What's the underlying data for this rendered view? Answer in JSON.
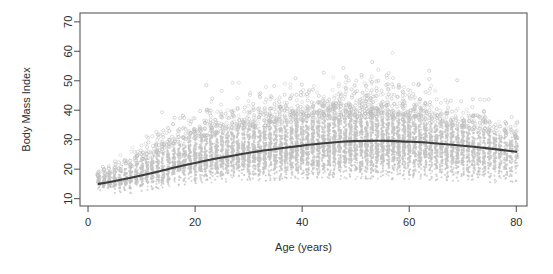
{
  "chart_data": {
    "type": "scatter",
    "title": "",
    "subtitle": "",
    "xlabel": "Age (years)",
    "ylabel": "Body Mass Index",
    "xlim": [
      -1.5,
      82
    ],
    "ylim": [
      7.5,
      73
    ],
    "xticks": [
      0,
      20,
      40,
      60,
      80
    ],
    "yticks": [
      10,
      20,
      30,
      40,
      50,
      60,
      70
    ],
    "grid": false,
    "legend": null,
    "point_color": "#bdbdbd",
    "point_symbol": "open-circle",
    "point_size_px": 2,
    "curve_color": "#3c3c3c",
    "frame_color": "#595959",
    "background": "#ffffff",
    "series": [
      {
        "name": "BMI by age (observations)",
        "description": "Dense vertical columns of light gray open circles at integer ages from 2 to 80; spread widens with age, floor rises from about 12 in childhood to about 17 in adulthood, ceiling rises to about 65.",
        "n_points_approx": 9000,
        "x_range": [
          2,
          80
        ],
        "y_range": [
          11,
          66
        ],
        "column_profile": [
          {
            "age": 2,
            "median": 16.2,
            "p05": 13.6,
            "p95": 19.4,
            "max": 22.5,
            "density": 0.3
          },
          {
            "age": 4,
            "median": 16.0,
            "p05": 13.4,
            "p95": 20.4,
            "max": 25.0,
            "density": 0.34
          },
          {
            "age": 6,
            "median": 16.4,
            "p05": 13.5,
            "p95": 22.5,
            "max": 28.0,
            "density": 0.38
          },
          {
            "age": 8,
            "median": 17.4,
            "p05": 13.9,
            "p95": 25.0,
            "max": 31.0,
            "density": 0.42
          },
          {
            "age": 10,
            "median": 18.6,
            "p05": 14.4,
            "p95": 27.5,
            "max": 34.0,
            "density": 0.46
          },
          {
            "age": 12,
            "median": 20.0,
            "p05": 15.0,
            "p95": 30.0,
            "max": 37.5,
            "density": 0.5
          },
          {
            "age": 14,
            "median": 21.3,
            "p05": 15.8,
            "p95": 32.0,
            "max": 40.0,
            "density": 0.54
          },
          {
            "age": 16,
            "median": 22.4,
            "p05": 16.5,
            "p95": 34.0,
            "max": 43.0,
            "density": 0.58
          },
          {
            "age": 18,
            "median": 23.3,
            "p05": 17.0,
            "p95": 36.0,
            "max": 46.0,
            "density": 0.62
          },
          {
            "age": 20,
            "median": 24.0,
            "p05": 17.3,
            "p95": 37.5,
            "max": 48.0,
            "density": 0.66
          },
          {
            "age": 25,
            "median": 25.4,
            "p05": 17.8,
            "p95": 40.0,
            "max": 52.0,
            "density": 0.74
          },
          {
            "age": 30,
            "median": 26.5,
            "p05": 18.1,
            "p95": 42.0,
            "max": 55.0,
            "density": 0.8
          },
          {
            "age": 35,
            "median": 27.5,
            "p05": 18.3,
            "p95": 43.5,
            "max": 57.0,
            "density": 0.86
          },
          {
            "age": 40,
            "median": 28.4,
            "p05": 18.5,
            "p95": 45.0,
            "max": 60.0,
            "density": 0.92
          },
          {
            "age": 45,
            "median": 29.1,
            "p05": 18.7,
            "p95": 46.0,
            "max": 63.0,
            "density": 0.96
          },
          {
            "age": 50,
            "median": 29.6,
            "p05": 18.8,
            "p95": 46.5,
            "max": 65.0,
            "density": 1.0
          },
          {
            "age": 55,
            "median": 29.6,
            "p05": 18.8,
            "p95": 46.0,
            "max": 63.0,
            "density": 0.97
          },
          {
            "age": 60,
            "median": 29.2,
            "p05": 18.6,
            "p95": 45.0,
            "max": 60.0,
            "density": 0.9
          },
          {
            "age": 65,
            "median": 28.6,
            "p05": 18.4,
            "p95": 43.0,
            "max": 56.0,
            "density": 0.8
          },
          {
            "age": 70,
            "median": 27.8,
            "p05": 18.0,
            "p95": 41.0,
            "max": 52.0,
            "density": 0.68
          },
          {
            "age": 75,
            "median": 27.0,
            "p05": 17.6,
            "p95": 38.5,
            "max": 48.0,
            "density": 0.54
          },
          {
            "age": 80,
            "median": 26.0,
            "p05": 17.0,
            "p95": 36.0,
            "max": 44.0,
            "density": 0.4
          }
        ]
      },
      {
        "name": "Smoothed trend",
        "type": "line",
        "color": "#3c3c3c",
        "points": [
          {
            "x": 2,
            "y": 15.0
          },
          {
            "x": 5,
            "y": 16.0
          },
          {
            "x": 8,
            "y": 17.1
          },
          {
            "x": 11,
            "y": 18.3
          },
          {
            "x": 14,
            "y": 19.6
          },
          {
            "x": 17,
            "y": 20.9
          },
          {
            "x": 20,
            "y": 22.1
          },
          {
            "x": 24,
            "y": 23.6
          },
          {
            "x": 28,
            "y": 24.9
          },
          {
            "x": 32,
            "y": 26.1
          },
          {
            "x": 36,
            "y": 27.1
          },
          {
            "x": 40,
            "y": 28.0
          },
          {
            "x": 44,
            "y": 28.8
          },
          {
            "x": 48,
            "y": 29.4
          },
          {
            "x": 52,
            "y": 29.6
          },
          {
            "x": 56,
            "y": 29.6
          },
          {
            "x": 60,
            "y": 29.3
          },
          {
            "x": 64,
            "y": 28.9
          },
          {
            "x": 68,
            "y": 28.3
          },
          {
            "x": 72,
            "y": 27.6
          },
          {
            "x": 76,
            "y": 26.8
          },
          {
            "x": 80,
            "y": 25.9
          }
        ]
      }
    ]
  }
}
